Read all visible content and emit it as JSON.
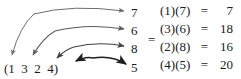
{
  "figure": {
    "background_color": "#ffffff",
    "ink_color": "#1a1a1a",
    "equals_sign": "=",
    "cycle": {
      "open_paren": "(",
      "elements": [
        "1",
        "3",
        "2",
        "4"
      ],
      "close_paren": ")",
      "full_text": "(1  3  2  4)"
    },
    "targets": [
      {
        "label": "7"
      },
      {
        "label": "6"
      },
      {
        "label": "8"
      },
      {
        "label": "5"
      }
    ],
    "arrows": [
      {
        "from": "1",
        "to": "7",
        "shade": "#6d6d6d",
        "width": 1.0
      },
      {
        "from": "3",
        "to": "6",
        "shade": "#5a5a5a",
        "width": 1.1
      },
      {
        "from": "2",
        "to": "8",
        "shade": "#424242",
        "width": 1.2
      },
      {
        "from": "4",
        "to": "5",
        "shade": "#1f1f1f",
        "width": 1.6
      }
    ],
    "products": [
      {
        "left": "(1)",
        "right": "(7)",
        "eq": "=",
        "result": "7"
      },
      {
        "left": "(3)",
        "right": "(6)",
        "eq": "=",
        "result": "18"
      },
      {
        "left": "(2)",
        "right": "(8)",
        "eq": "=",
        "result": "16"
      },
      {
        "left": "(4)",
        "right": "(5)",
        "eq": "=",
        "result": "20"
      }
    ]
  }
}
